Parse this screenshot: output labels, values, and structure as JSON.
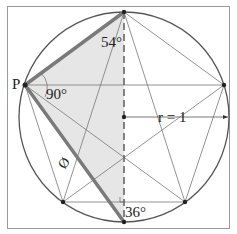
{
  "diagram": {
    "type": "geometry",
    "labels": {
      "point_p": "P",
      "angle_top": "54°",
      "angle_p": "90°",
      "angle_bottom": "36°",
      "radius": "r = 1",
      "side": "Ø"
    },
    "colors": {
      "frame": "#9a9a9a",
      "circle": "#555555",
      "thin_lines": "#777777",
      "thick_lines": "#7a7a7a",
      "shade": "#e6e6e6",
      "points": "#222222"
    },
    "points": {
      "top": [
        124,
        12
      ],
      "p": [
        25,
        85
      ],
      "right": [
        224,
        85
      ],
      "bottom_left": [
        63,
        202
      ],
      "bottom_right": [
        185,
        202
      ],
      "bottom": [
        124,
        222
      ],
      "center": [
        124,
        117
      ]
    }
  }
}
